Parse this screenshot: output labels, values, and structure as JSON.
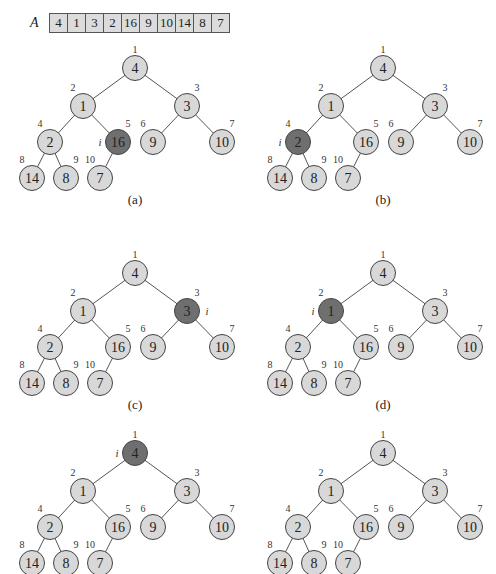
{
  "array": {
    "label": "A",
    "values": [
      "4",
      "1",
      "3",
      "2",
      "16",
      "9",
      "10",
      "14",
      "8",
      "7"
    ]
  },
  "tree": {
    "indices": [
      "1",
      "2",
      "3",
      "4",
      "5",
      "6",
      "7",
      "8",
      "9",
      "10"
    ],
    "edges": [
      [
        1,
        2
      ],
      [
        1,
        3
      ],
      [
        2,
        4
      ],
      [
        2,
        5
      ],
      [
        3,
        6
      ],
      [
        3,
        7
      ],
      [
        4,
        8
      ],
      [
        4,
        9
      ],
      [
        5,
        10
      ]
    ],
    "colors": {
      "node_fill": "#d8d8d8",
      "highlight_fill": "#6f6f6f",
      "edge": "#555555"
    }
  },
  "panels": [
    {
      "caption": "(a)",
      "values": [
        "4",
        "1",
        "3",
        "2",
        "16",
        "9",
        "10",
        "14",
        "8",
        "7"
      ],
      "highlight": 5,
      "i_label": "i",
      "i_side": "left"
    },
    {
      "caption": "(b)",
      "values": [
        "4",
        "1",
        "3",
        "2",
        "16",
        "9",
        "10",
        "14",
        "8",
        "7"
      ],
      "highlight": 4,
      "i_label": "i",
      "i_side": "left"
    },
    {
      "caption": "(c)",
      "values": [
        "4",
        "1",
        "3",
        "2",
        "16",
        "9",
        "10",
        "14",
        "8",
        "7"
      ],
      "highlight": 3,
      "i_label": "i",
      "i_side": "right"
    },
    {
      "caption": "(d)",
      "values": [
        "4",
        "1",
        "3",
        "2",
        "16",
        "9",
        "10",
        "14",
        "8",
        "7"
      ],
      "highlight": 2,
      "i_label": "i",
      "i_side": "left"
    },
    {
      "caption": "(e)",
      "values": [
        "4",
        "1",
        "3",
        "2",
        "16",
        "9",
        "10",
        "14",
        "8",
        "7"
      ],
      "highlight": 1,
      "i_label": "i",
      "i_side": "left"
    },
    {
      "caption": "(f)",
      "values": [
        "4",
        "1",
        "3",
        "2",
        "16",
        "9",
        "10",
        "14",
        "8",
        "7"
      ],
      "highlight": null,
      "i_label": "",
      "i_side": ""
    }
  ]
}
